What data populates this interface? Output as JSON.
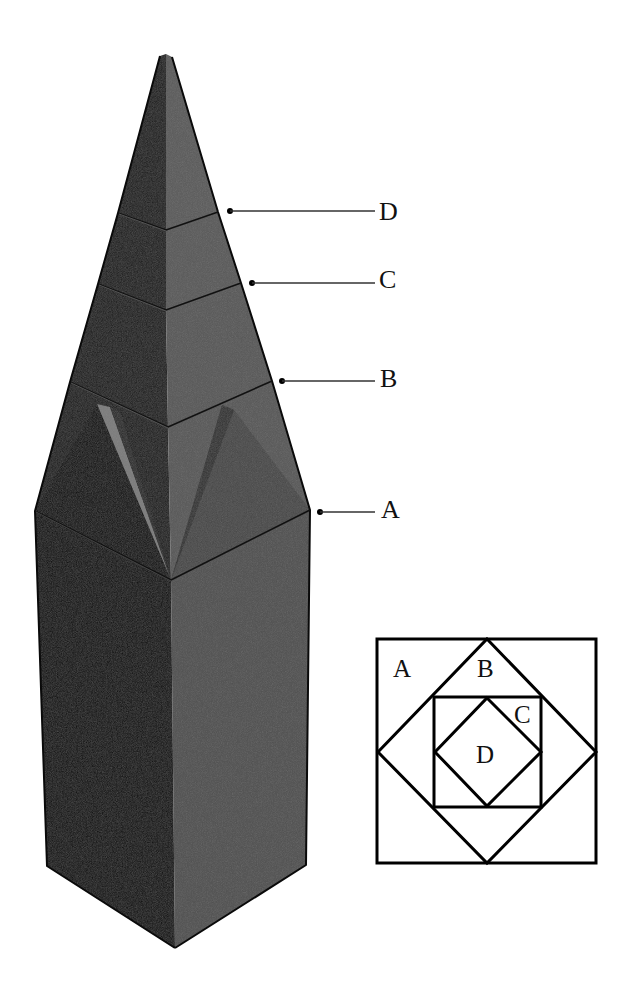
{
  "diagram": {
    "colors": {
      "background": "#ffffff",
      "dark_face": "#050505",
      "dark_face_upper": "#1c1c1c",
      "light_face": "#4e4e4e",
      "light_face_upper": "#555555",
      "broach_highlight": "#7a7a7a",
      "edge": "#0a0a0a",
      "leader": "#333333"
    },
    "callouts": [
      {
        "id": "D",
        "label": "D"
      },
      {
        "id": "C",
        "label": "C"
      },
      {
        "id": "B",
        "label": "B"
      },
      {
        "id": "A",
        "label": "A"
      }
    ],
    "plan_inset": {
      "labels": [
        {
          "id": "A",
          "label": "A"
        },
        {
          "id": "B",
          "label": "B"
        },
        {
          "id": "C",
          "label": "C"
        },
        {
          "id": "D",
          "label": "D"
        }
      ]
    }
  }
}
